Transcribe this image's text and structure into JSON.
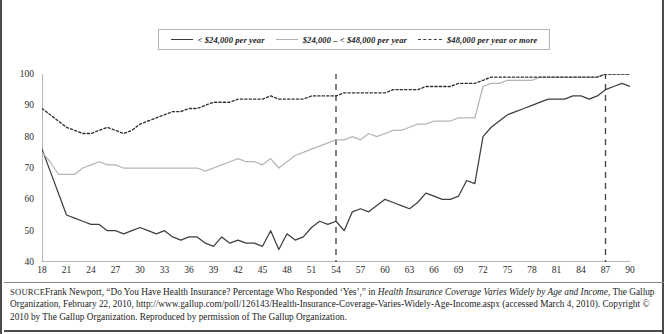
{
  "legend": {
    "items": [
      {
        "label": "< $24,000 per year",
        "style": "solid-dark",
        "color": "#3f3f3f"
      },
      {
        "label": "$24,000 – < $48,000 per year",
        "style": "solid-light",
        "color": "#b5b5b5"
      },
      {
        "label": "$48,000 per year or more",
        "style": "dotted",
        "color": "#2f2f2f"
      }
    ]
  },
  "source": {
    "prefix": "SOURCE",
    "line1_a": "Frank Newport, “Do You Have Health Insurance? Percentage Who Responded ‘Yes’,” in ",
    "line1_italic": "Health Insurance Coverage Varies Widely by Age and Income",
    "line1_b": ", The Gallup Organization, February 22, 2010, http://www.gallup.com/poll/126143/Health-Insurance-Coverage-Varies-Widely-Age-Income.aspx (accessed March 4, 2010). Copyright © 2010 by The Gallup Organization. Reproduced by permission of The Gallup Organization."
  },
  "chart_data": {
    "type": "line",
    "title": "",
    "subtitle": "",
    "xlabel": "",
    "ylabel": "",
    "xlim": [
      18,
      90
    ],
    "ylim": [
      40,
      100
    ],
    "yticks": [
      40,
      50,
      60,
      70,
      80,
      90,
      100
    ],
    "xticks": [
      18,
      21,
      24,
      27,
      30,
      33,
      36,
      39,
      42,
      45,
      48,
      51,
      54,
      57,
      60,
      63,
      66,
      69,
      72,
      75,
      78,
      81,
      84,
      87,
      90
    ],
    "xtick_minor_step": 1,
    "grid": false,
    "legend_position": "top",
    "reference_lines": [
      {
        "x": 54,
        "style": "dashed",
        "color": "#4a4a4a"
      },
      {
        "x": 87,
        "style": "dashed",
        "color": "#4a4a4a"
      }
    ],
    "x": [
      18,
      19,
      20,
      21,
      22,
      23,
      24,
      25,
      26,
      27,
      28,
      29,
      30,
      31,
      32,
      33,
      34,
      35,
      36,
      37,
      38,
      39,
      40,
      41,
      42,
      43,
      44,
      45,
      46,
      47,
      48,
      49,
      50,
      51,
      52,
      53,
      54,
      55,
      56,
      57,
      58,
      59,
      60,
      61,
      62,
      63,
      64,
      65,
      66,
      67,
      68,
      69,
      70,
      71,
      72,
      73,
      74,
      75,
      76,
      77,
      78,
      79,
      80,
      81,
      82,
      83,
      84,
      85,
      86,
      87,
      88,
      89,
      90
    ],
    "series": [
      {
        "name": "< $24,000 per year",
        "style": "solid-dark",
        "color": "#3f3f3f",
        "values": [
          76,
          69,
          62,
          55,
          54,
          53,
          52,
          52,
          50,
          50,
          49,
          50,
          51,
          50,
          49,
          50,
          48,
          47,
          48,
          48,
          46,
          45,
          48,
          46,
          47,
          46,
          46,
          45,
          50,
          44,
          49,
          47,
          48,
          51,
          53,
          52,
          53,
          50,
          56,
          57,
          56,
          58,
          60,
          59,
          58,
          57,
          59,
          62,
          61,
          60,
          60,
          61,
          66,
          65,
          80,
          83,
          85,
          87,
          88,
          89,
          90,
          91,
          92,
          92,
          92,
          93,
          93,
          92,
          93,
          95,
          96,
          97,
          96
        ]
      },
      {
        "name": "$24,000 – < $48,000 per year",
        "style": "solid-light",
        "color": "#b5b5b5",
        "values": [
          75,
          72,
          68,
          68,
          68,
          70,
          71,
          72,
          71,
          71,
          70,
          70,
          70,
          70,
          70,
          70,
          70,
          70,
          70,
          70,
          69,
          70,
          71,
          72,
          73,
          72,
          72,
          71,
          73,
          70,
          72,
          74,
          75,
          76,
          77,
          78,
          79,
          79,
          80,
          79,
          81,
          80,
          81,
          82,
          82,
          83,
          84,
          84,
          85,
          85,
          85,
          86,
          86,
          86,
          96,
          97,
          97,
          98,
          98,
          98,
          98,
          99,
          99,
          99,
          99,
          99,
          99,
          99,
          99,
          100,
          100,
          100,
          100
        ]
      },
      {
        "name": "$48,000 per year or more",
        "style": "dotted",
        "color": "#2f2f2f",
        "values": [
          89,
          87,
          85,
          83,
          82,
          81,
          81,
          82,
          83,
          82,
          81,
          82,
          84,
          85,
          86,
          87,
          88,
          88,
          89,
          89,
          90,
          91,
          91,
          91,
          92,
          92,
          92,
          92,
          93,
          92,
          92,
          92,
          92,
          93,
          93,
          93,
          93,
          94,
          94,
          94,
          94,
          94,
          94,
          95,
          95,
          95,
          95,
          96,
          96,
          96,
          96,
          97,
          97,
          97,
          98,
          99,
          99,
          99,
          99,
          99,
          99,
          99,
          99,
          99,
          99,
          99,
          99,
          99,
          99,
          100,
          100,
          100,
          100
        ]
      }
    ]
  }
}
